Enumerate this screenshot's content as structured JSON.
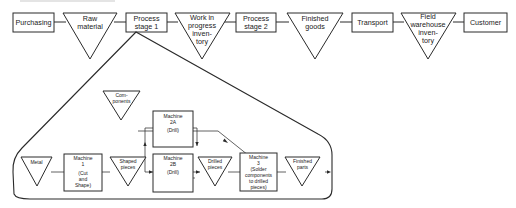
{
  "top_flow": {
    "nodes": [
      {
        "id": "purchasing",
        "shape": "box",
        "lines": [
          "Purchasing"
        ]
      },
      {
        "id": "raw-material",
        "shape": "triangle",
        "lines": [
          "Raw",
          "material"
        ]
      },
      {
        "id": "process-stage-1",
        "shape": "box",
        "lines": [
          "Process",
          "stage 1"
        ]
      },
      {
        "id": "wip-inventory",
        "shape": "triangle",
        "lines": [
          "Work in",
          "progress",
          "inven-",
          "tory"
        ]
      },
      {
        "id": "process-stage-2",
        "shape": "box",
        "lines": [
          "Process",
          "stage 2"
        ]
      },
      {
        "id": "finished-goods",
        "shape": "triangle",
        "lines": [
          "Finished",
          "goods"
        ]
      },
      {
        "id": "transport",
        "shape": "box",
        "lines": [
          "Transport"
        ]
      },
      {
        "id": "field-warehouse-inventory",
        "shape": "triangle",
        "lines": [
          "Field",
          "warehouse",
          "inven-",
          "tory"
        ]
      },
      {
        "id": "customer",
        "shape": "box",
        "lines": [
          "Customer"
        ]
      }
    ]
  },
  "detail_flow": {
    "expands": "process-stage-1",
    "nodes": [
      {
        "id": "metal",
        "shape": "triangle",
        "lines": [
          "Metal"
        ]
      },
      {
        "id": "machine-1",
        "shape": "box",
        "lines": [
          "Machine",
          "1",
          "(Cut",
          "and",
          "Shape)"
        ]
      },
      {
        "id": "shaped-pieces",
        "shape": "triangle",
        "lines": [
          "Shaped",
          "pieces"
        ]
      },
      {
        "id": "machine-2a",
        "shape": "box",
        "lines": [
          "Machine",
          "2A",
          "(Drill)"
        ]
      },
      {
        "id": "machine-2b",
        "shape": "box",
        "lines": [
          "Machine",
          "2B",
          "(Drill)"
        ]
      },
      {
        "id": "drilled-pieces",
        "shape": "triangle",
        "lines": [
          "Drilled",
          "pieces"
        ]
      },
      {
        "id": "machine-3",
        "shape": "box",
        "lines": [
          "Machine",
          "3",
          "(Solder",
          "components",
          "to drilled",
          "pieces)"
        ]
      },
      {
        "id": "finished-parts",
        "shape": "triangle",
        "lines": [
          "Finished",
          "parts"
        ]
      },
      {
        "id": "components",
        "shape": "triangle",
        "lines": [
          "Com-",
          "ponents"
        ]
      }
    ]
  }
}
